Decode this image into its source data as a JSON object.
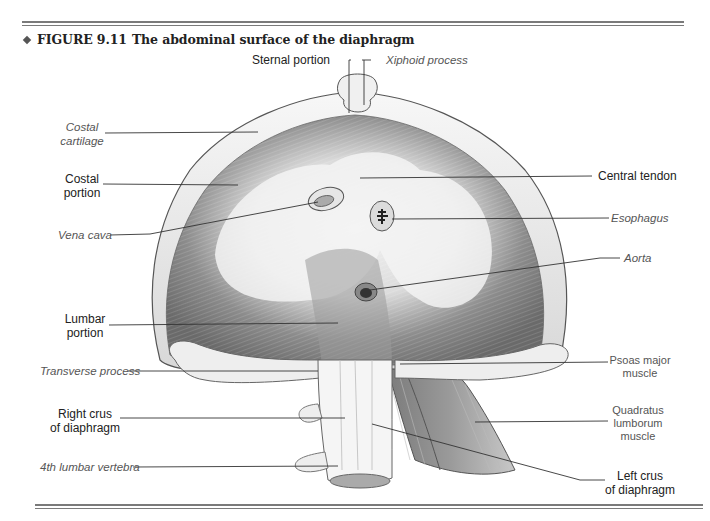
{
  "figure": {
    "number": "FIGURE 9.11",
    "title": "The abdominal surface of the diaphragm",
    "bullet_icon": "diamond-bullet-icon"
  },
  "labels": {
    "sternal_portion": "Sternal portion",
    "xiphoid_process": "Xiphoid process",
    "costal_cartilage": [
      "Costal",
      "cartilage"
    ],
    "costal_portion": [
      "Costal",
      "portion"
    ],
    "central_tendon": "Central tendon",
    "vena_cava": "Vena cava",
    "esophagus": "Esophagus",
    "aorta": "Aorta",
    "lumbar_portion": [
      "Lumbar",
      "portion"
    ],
    "transverse_process": "Transverse process",
    "psoas_major_muscle": [
      "Psoas major",
      "muscle"
    ],
    "right_crus": [
      "Right crus",
      "of diaphragm"
    ],
    "quadratus_lumborum_muscle": [
      "Quadratus",
      "lumborum",
      "muscle"
    ],
    "fourth_lumbar_vertebra": "4th lumbar vertebra",
    "left_crus": [
      "Left crus",
      "of diaphragm"
    ]
  },
  "colors": {
    "rule": "#7a7a7a",
    "muscle_dark": "#6e6e6e",
    "tendon_light": "#f2f2f2",
    "outline": "#555555",
    "leader_line": "#333333"
  }
}
